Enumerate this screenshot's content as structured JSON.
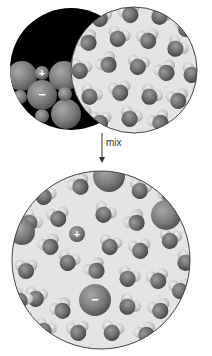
{
  "figure": {
    "arrow_label": "mix",
    "colors": {
      "background": "#ffffff",
      "solid_background": "#000000",
      "water_background": "#e4e4e4",
      "outline": "#444444",
      "ion": "#7a7a7a",
      "water_oxygen": "#6a6a6a",
      "water_hydrogen": "#c4c4c4",
      "ion_sign": "#ffffff"
    }
  },
  "top": {
    "solid_panel": {
      "name": "ionic-solid",
      "circle": {
        "cx": 71,
        "cy": 69,
        "r": 61
      },
      "ions": [
        {
          "type": "cation",
          "sign": "+",
          "cx": 42,
          "cy": 73,
          "r": 7
        },
        {
          "type": "anion",
          "sign": "−",
          "cx": 42,
          "cy": 95,
          "r": 15
        },
        {
          "type": "anion",
          "sign": "",
          "cx": 22,
          "cy": 76,
          "r": 15
        },
        {
          "type": "anion",
          "sign": "",
          "cx": 64,
          "cy": 76,
          "r": 15
        },
        {
          "type": "anion",
          "sign": "",
          "cx": 66,
          "cy": 114,
          "r": 15
        },
        {
          "type": "cation",
          "sign": "",
          "cx": 65,
          "cy": 94,
          "r": 7
        },
        {
          "type": "cation",
          "sign": "",
          "cx": 42,
          "cy": 116,
          "r": 7
        },
        {
          "type": "cation",
          "sign": "",
          "cx": 20,
          "cy": 97,
          "r": 7
        }
      ]
    },
    "water_panel": {
      "name": "water",
      "circle": {
        "cx": 134,
        "cy": 70,
        "r": 63
      }
    }
  },
  "bottom": {
    "solution_panel": {
      "name": "solution",
      "circle": {
        "cx": 101,
        "cy": 260,
        "r": 89
      },
      "ions": [
        {
          "type": "cation",
          "sign": "+",
          "cx": 77,
          "cy": 234,
          "r": 8
        },
        {
          "type": "anion",
          "sign": "−",
          "cx": 95,
          "cy": 300,
          "r": 16
        },
        {
          "type": "anion",
          "sign": "",
          "cx": 109,
          "cy": 176,
          "r": 16
        },
        {
          "type": "anion",
          "sign": "",
          "cx": 166,
          "cy": 215,
          "r": 15
        },
        {
          "type": "anion",
          "sign": "",
          "cx": 22,
          "cy": 232,
          "r": 13
        }
      ]
    }
  }
}
